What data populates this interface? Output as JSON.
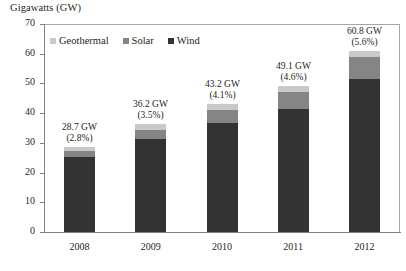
{
  "chart_data": {
    "type": "bar",
    "subtype": "stacked-column",
    "title": "Gigawatts (GW)",
    "xlabel": "",
    "ylabel": "Gigawatts (GW)",
    "ylim": [
      0,
      70
    ],
    "ytick_step": 10,
    "yticks": [
      70,
      60,
      50,
      40,
      30,
      20,
      10,
      0
    ],
    "grid": false,
    "legend_position": "top-left-inside",
    "categories": [
      "2008",
      "2009",
      "2010",
      "2011",
      "2012"
    ],
    "series": [
      {
        "name": "Wind",
        "color": "#333333",
        "values": [
          25.1,
          31.2,
          36.8,
          41.4,
          51.6
        ]
      },
      {
        "name": "Solar",
        "color": "#858585",
        "values": [
          2.0,
          3.2,
          4.3,
          5.6,
          7.2
        ]
      },
      {
        "name": "Geothermal",
        "color": "#c9c9c9",
        "values": [
          1.6,
          1.8,
          2.1,
          2.1,
          2.0
        ]
      }
    ],
    "totals": [
      28.7,
      36.2,
      43.2,
      49.1,
      60.8
    ],
    "annotations": [
      {
        "category": "2008",
        "total_label": "28.7 GW",
        "pct_label": "(2.8%)"
      },
      {
        "category": "2009",
        "total_label": "36.2 GW",
        "pct_label": "(3.5%)"
      },
      {
        "category": "2010",
        "total_label": "43.2 GW",
        "pct_label": "(4.1%)"
      },
      {
        "category": "2011",
        "total_label": "49.1 GW",
        "pct_label": "(4.6%)"
      },
      {
        "category": "2012",
        "total_label": "60.8 GW",
        "pct_label": "(5.6%)"
      }
    ]
  },
  "legend": {
    "items": [
      {
        "label": "Geothermal",
        "color": "#c9c9c9"
      },
      {
        "label": "Solar",
        "color": "#858585"
      },
      {
        "label": "Wind",
        "color": "#333333"
      }
    ]
  },
  "colors": {
    "axis": "#808080",
    "frame": "#a6a6a6",
    "text": "#231f20",
    "background": "#ffffff"
  }
}
